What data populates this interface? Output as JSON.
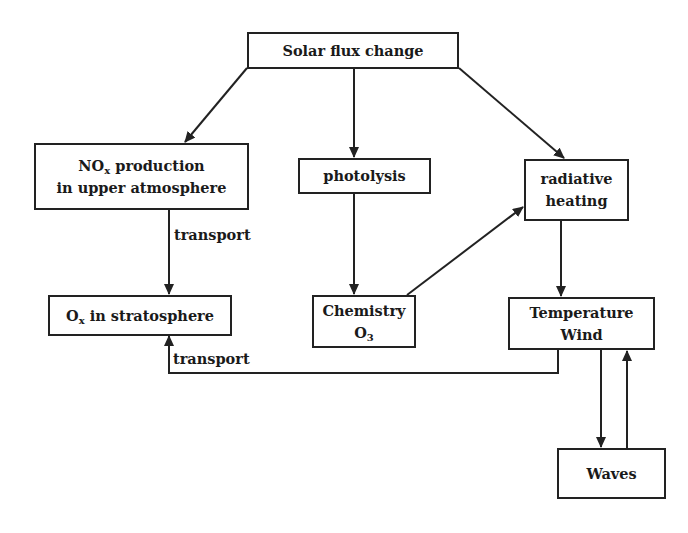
{
  "diagram": {
    "nodes": {
      "solar_flux": {
        "label": "Solar flux change"
      },
      "nox": {
        "line1_main": "NO",
        "line1_sub": "x",
        "line1_rest": " production",
        "line2": "in upper atmosphere"
      },
      "photolysis": {
        "label": "photolysis"
      },
      "radiative": {
        "line1": "radiative",
        "line2": "heating"
      },
      "ox": {
        "main": "O",
        "sub": "x",
        "rest": " in stratosphere"
      },
      "chemistry": {
        "line1": "Chemistry",
        "line2_main": "O",
        "line2_sub": "3"
      },
      "temperature": {
        "line1": "Temperature",
        "line2": "Wind"
      },
      "waves": {
        "label": "Waves"
      }
    },
    "edge_labels": {
      "transport_nox_ox": "transport",
      "transport_temp_ox": "transport"
    },
    "edges": [
      {
        "from": "Solar flux change",
        "to": "NOx production in upper atmosphere"
      },
      {
        "from": "Solar flux change",
        "to": "photolysis"
      },
      {
        "from": "Solar flux change",
        "to": "radiative heating"
      },
      {
        "from": "NOx production in upper atmosphere",
        "to": "Ox in stratosphere",
        "label": "transport"
      },
      {
        "from": "photolysis",
        "to": "Chemistry O3"
      },
      {
        "from": "Chemistry O3",
        "to": "radiative heating"
      },
      {
        "from": "radiative heating",
        "to": "Temperature Wind"
      },
      {
        "from": "Temperature Wind",
        "to": "Ox in stratosphere",
        "label": "transport"
      },
      {
        "from": "Temperature Wind",
        "to": "Waves"
      },
      {
        "from": "Waves",
        "to": "Temperature Wind"
      }
    ],
    "colors": {
      "stroke": "#222222",
      "background": "#ffffff"
    }
  }
}
